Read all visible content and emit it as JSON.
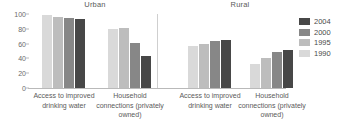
{
  "chart_data": {
    "type": "bar",
    "title": "",
    "panels": [
      {
        "name": "Urban",
        "categories": [
          "Access to improved drinking water",
          "Household connections (privately owned)"
        ],
        "series": [
          {
            "name": "1990",
            "values": [
              98,
              80
            ]
          },
          {
            "name": "1995",
            "values": [
              96,
              81
            ]
          },
          {
            "name": "2000",
            "values": [
              94,
              61
            ]
          },
          {
            "name": "2004",
            "values": [
              93,
              43
            ]
          }
        ]
      },
      {
        "name": "Rural",
        "categories": [
          "Access to improved drinking water",
          "Household connections (privately owned)"
        ],
        "series": [
          {
            "name": "1990",
            "values": [
              57,
              33
            ]
          },
          {
            "name": "1995",
            "values": [
              59,
              41
            ]
          },
          {
            "name": "2000",
            "values": [
              64,
              49
            ]
          },
          {
            "name": "2004",
            "values": [
              65,
              52
            ]
          }
        ]
      }
    ],
    "xlabel": "",
    "ylabel": "",
    "ylim": [
      0,
      100
    ],
    "yticks": [
      0,
      20,
      40,
      60,
      80,
      100
    ],
    "grid": false,
    "legend": {
      "position": "right",
      "entries": [
        {
          "label": "2004",
          "color": "#474747"
        },
        {
          "label": "2000",
          "color": "#878787"
        },
        {
          "label": "1995",
          "color": "#bdbdbd"
        },
        {
          "label": "1990",
          "color": "#d9d9d9"
        }
      ]
    },
    "colors": {
      "1990": "#d9d9d9",
      "1995": "#bdbdbd",
      "2000": "#878787",
      "2004": "#474747",
      "axis": "#b9b9b9",
      "text": "#5a5a5a"
    }
  }
}
